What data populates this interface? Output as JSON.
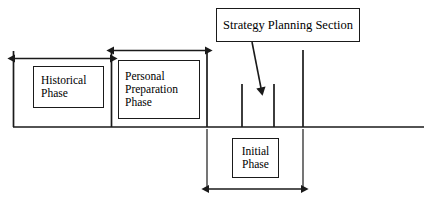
{
  "diagram": {
    "title_box": {
      "label": "Strategy Planning Section",
      "name": "strategy-planning-section-box"
    },
    "phases": [
      {
        "id": "historical",
        "lines": [
          "Historical",
          "Phase"
        ],
        "measure_label": "historical-phase-span-arrow"
      },
      {
        "id": "personal",
        "lines": [
          "Personal",
          "Preparation",
          "Phase"
        ],
        "measure_label": "personal-preparation-phase-span-arrow"
      },
      {
        "id": "initial",
        "lines": [
          "Initial",
          "Phase"
        ],
        "measure_label": "initial-phase-span-arrow"
      }
    ],
    "colors": {
      "stroke": "#1a1a1a",
      "background": "#ffffff",
      "text": "#000000"
    }
  }
}
